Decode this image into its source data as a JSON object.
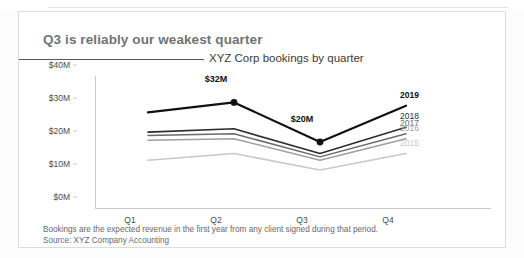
{
  "title": "Q3 is reliably our weakest quarter",
  "subtitle": "XYZ Corp bookings by quarter",
  "footnote": {
    "line1": "Bookings are the expected revenue in the first year from any client signed during that period.",
    "line2": "Source: XYZ Company Accounting"
  },
  "colors": {
    "title": "#6e7478",
    "subtitle": "#3b3b3b",
    "axis": "#c9c9c9",
    "footnote": "#66696c",
    "series_2019": "#111111",
    "series_2018": "#2e2e2e",
    "series_2017": "#6a6a6a",
    "series_2016": "#a0a0a0",
    "series_2015": "#c8c8c8"
  },
  "chart_data": {
    "type": "line",
    "title": "Q3 is reliably our weakest quarter",
    "subtitle": "XYZ Corp bookings by quarter",
    "xlabel": "",
    "ylabel": "",
    "categories": [
      "Q1",
      "Q2",
      "Q3",
      "Q4"
    ],
    "ylim": [
      0,
      40
    ],
    "yticks": [
      {
        "value": 40,
        "label": "$40M"
      },
      {
        "value": 30,
        "label": "$30M"
      },
      {
        "value": 20,
        "label": "$20M"
      },
      {
        "value": 10,
        "label": "$10M"
      },
      {
        "value": 0,
        "label": "$0M"
      }
    ],
    "grid": false,
    "legend": "right-inline-series-labels",
    "series": [
      {
        "name": "2019",
        "label": "2019",
        "color": "#111111",
        "width": 2.2,
        "emphasis": true,
        "values": [
          29,
          32,
          20,
          31
        ]
      },
      {
        "name": "2018",
        "label": "2018",
        "color": "#2e2e2e",
        "width": 1.6,
        "emphasis": false,
        "values": [
          23,
          24,
          16.5,
          24.5
        ]
      },
      {
        "name": "2017",
        "label": "2017",
        "color": "#6a6a6a",
        "width": 1.5,
        "emphasis": false,
        "values": [
          22,
          22.5,
          15.5,
          22.5
        ]
      },
      {
        "name": "2016",
        "label": "2016",
        "color": "#a0a0a0",
        "width": 1.5,
        "emphasis": false,
        "values": [
          20.5,
          21,
          14.5,
          21
        ]
      },
      {
        "name": "2015",
        "label": "2015",
        "color": "#c8c8c8",
        "width": 1.5,
        "emphasis": false,
        "values": [
          14.5,
          16.5,
          11.5,
          16.5
        ]
      }
    ],
    "annotations": [
      {
        "series": "2019",
        "category": "Q2",
        "value": 32,
        "label": "$32M",
        "marker": true
      },
      {
        "series": "2019",
        "category": "Q3",
        "value": 20,
        "label": "$20M",
        "marker": true
      }
    ]
  }
}
